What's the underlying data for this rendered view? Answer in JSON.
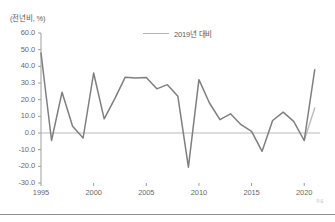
{
  "chart_data": {
    "type": "line",
    "title": "",
    "subtitle": "",
    "ylabel": "(전년비, %)",
    "xlabel": "",
    "ylim": [
      -30.0,
      60.0
    ],
    "xlim": [
      1995,
      2021.5
    ],
    "grid": false,
    "zero_line": true,
    "legend_position": "top-center",
    "ytick_labels": [
      "60.0",
      "50.0",
      "40.0",
      "30.3",
      "20.0",
      "10.0",
      "0.0",
      "-10.0",
      "-20.0",
      "-30.0"
    ],
    "ytick_values": [
      60.0,
      50.0,
      40.0,
      30.0,
      20.0,
      10.0,
      0.0,
      -10.0,
      -20.0,
      -30.0
    ],
    "xtick_labels": [
      "1995",
      "2000",
      "2005",
      "2010",
      "2015",
      "2020"
    ],
    "xtick_values": [
      1995,
      2000,
      2005,
      2010,
      2015,
      2020
    ],
    "series": [
      {
        "name": "main",
        "color": "#7f7f7f",
        "legend_shown": false,
        "x": [
          1995,
          1996,
          1997,
          1998,
          1999,
          2000,
          2001,
          2002,
          2003,
          2004,
          2005,
          2006,
          2007,
          2008,
          2009,
          2010,
          2011,
          2012,
          2013,
          2014,
          2015,
          2016,
          2017,
          2018,
          2019,
          2020,
          2021
        ],
        "values": [
          48.0,
          -4.5,
          24.5,
          4.0,
          -3.0,
          36.0,
          8.5,
          20.5,
          33.5,
          33.0,
          33.3,
          26.5,
          29.0,
          22.0,
          -20.5,
          32.0,
          18.0,
          8.0,
          11.5,
          5.0,
          1.0,
          -11.0,
          7.5,
          12.5,
          7.0,
          -4.5,
          38.0
        ]
      },
      {
        "name": "2019년 대비",
        "color": "#bcbcbc",
        "legend_shown": true,
        "x": [
          2020,
          2021
        ],
        "values": [
          -4.5,
          15.0
        ]
      }
    ]
  },
  "legend": {
    "label": "2019년 대비"
  },
  "footer": {
    "corner_mark": "자료"
  }
}
